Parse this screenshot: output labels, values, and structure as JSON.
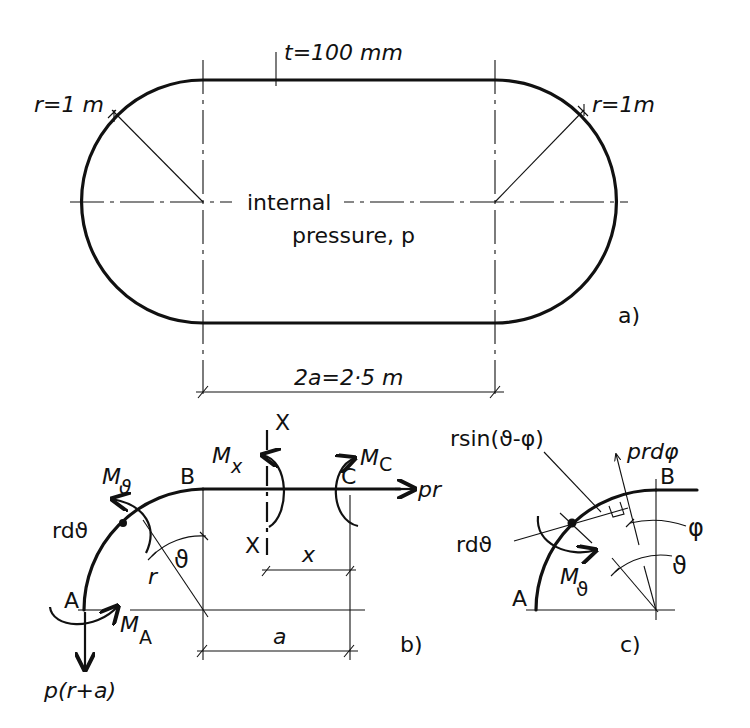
{
  "figure_a": {
    "thickness_label": "t=100 mm",
    "radius_left_label": "r=1 m",
    "radius_right_label": "r=1m",
    "pressure_line1": "internal",
    "pressure_line2": "pressure, p",
    "span_label": "2a=2·5 m",
    "panel_label": "a)"
  },
  "figure_b": {
    "point_a": "A",
    "point_b": "B",
    "point_c": "C",
    "section_top": "X",
    "section_bottom": "X",
    "moment_theta_M": "M",
    "moment_theta_sub": "ϑ",
    "moment_x_M": "M",
    "moment_x_sub": "x",
    "moment_c_M": "M",
    "moment_c_sub": "C",
    "moment_a_M": "M",
    "moment_a_sub": "A",
    "element_label": "rdϑ",
    "radius_label": "r",
    "angle_label": "ϑ",
    "distance_x_label": "x",
    "distance_a_label": "a",
    "force_pr_label": "pr",
    "force_vertical_label": "p(r+a)",
    "panel_label": "b)"
  },
  "figure_c": {
    "lever_arm_label": "rsin(ϑ-φ)",
    "force_label": "prdφ",
    "point_b": "B",
    "point_a": "A",
    "angle_phi_label": "φ",
    "angle_theta_label": "ϑ",
    "element_label": "rdϑ",
    "moment_M": "M",
    "moment_sub": "ϑ",
    "panel_label": "c)"
  }
}
